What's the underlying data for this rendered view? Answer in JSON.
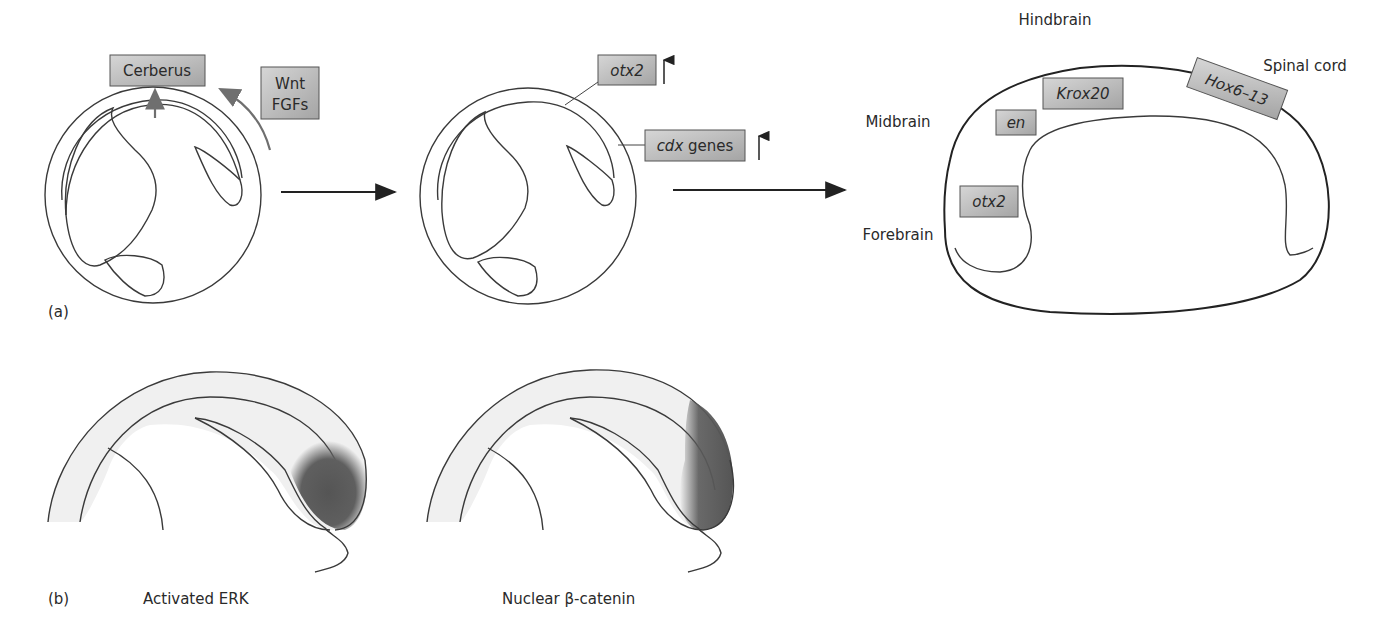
{
  "figure": {
    "panel_a": {
      "panel_label": "(a)",
      "stage1": {
        "cerberus_label": "Cerberus",
        "signal_label_line1": "Wnt",
        "signal_label_line2": "FGFs"
      },
      "stage2": {
        "otx2_label": "otx2",
        "cdx_label_italic": "cdx",
        "cdx_label_rest": " genes",
        "up_arrow": "↑"
      },
      "stage3": {
        "regions": {
          "hindbrain": "Hindbrain",
          "spinal_cord": "Spinal cord",
          "midbrain": "Midbrain",
          "forebrain": "Forebrain"
        },
        "genes": {
          "krox20": "Krox20",
          "en": "en",
          "hox": "Hox6–13",
          "otx2": "otx2"
        }
      }
    },
    "panel_b": {
      "panel_label": "(b)",
      "left_caption": "Activated ERK",
      "right_caption": "Nuclear β-catenin"
    },
    "colors": {
      "tissue_fill": "#efefef",
      "label_box_light": "#d2d2d2",
      "label_box_dark": "#a9a9a9",
      "signal_shading": "#5a5a5a",
      "arrow_gray": "#6f6f6f",
      "outline": "#333333"
    }
  }
}
